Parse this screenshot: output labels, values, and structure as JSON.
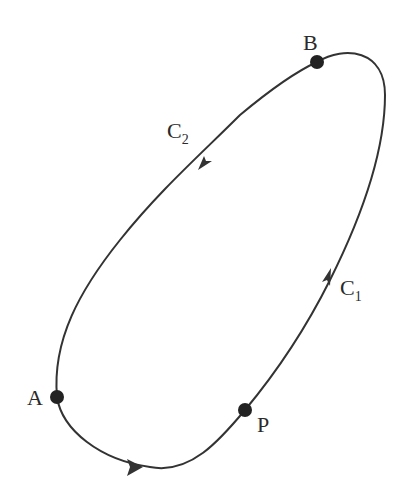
{
  "diagram": {
    "type": "closed-curve",
    "curve_color": "#333333",
    "background": "#ffffff",
    "points": [
      {
        "id": "A",
        "label": "A",
        "x": 57,
        "y": 397
      },
      {
        "id": "B",
        "label": "B",
        "x": 317,
        "y": 62
      },
      {
        "id": "P",
        "label": "P",
        "x": 245,
        "y": 410
      }
    ],
    "paths": [
      {
        "id": "C1",
        "label": "C",
        "subscript": "1",
        "direction": "A to B via P (counterclockwise, right side)"
      },
      {
        "id": "C2",
        "label": "C",
        "subscript": "2",
        "direction": "B to A (left side)"
      }
    ]
  }
}
